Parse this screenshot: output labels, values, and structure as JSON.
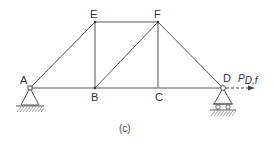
{
  "diagram": {
    "type": "truss",
    "caption": "(c)",
    "nodes": [
      {
        "id": "A",
        "label": "A"
      },
      {
        "id": "B",
        "label": "B"
      },
      {
        "id": "C",
        "label": "C"
      },
      {
        "id": "D",
        "label": "D"
      },
      {
        "id": "E",
        "label": "E"
      },
      {
        "id": "F",
        "label": "F"
      }
    ],
    "members": [
      "A-B",
      "B-C",
      "C-D",
      "A-E",
      "E-F",
      "E-B",
      "B-F",
      "F-C",
      "F-D"
    ],
    "supports": [
      {
        "node": "A",
        "type": "pin"
      },
      {
        "node": "D",
        "type": "roller"
      }
    ],
    "load": {
      "node": "D",
      "label_main": "P",
      "label_sub": "D,f",
      "direction": "right",
      "style": "dashed"
    }
  }
}
